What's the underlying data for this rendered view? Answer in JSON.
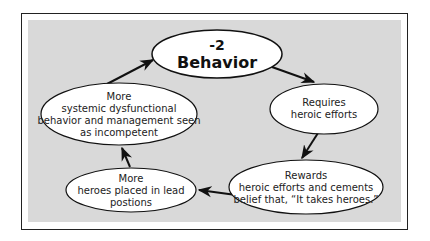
{
  "diagram": {
    "type": "cycle",
    "nodes": [
      {
        "id": "behavior",
        "lines": [
          "-2",
          "Behavior"
        ]
      },
      {
        "id": "requires",
        "lines": [
          "Requires",
          "heroic efforts"
        ]
      },
      {
        "id": "rewards",
        "lines": [
          "Rewards",
          "heroic efforts and cements",
          "belief that, “It takes heroes.”"
        ]
      },
      {
        "id": "heroes",
        "lines": [
          "More",
          "heroes placed in lead",
          "postions"
        ]
      },
      {
        "id": "systemic",
        "lines": [
          "More",
          "systemic dysfunctional",
          "behavior and management seen",
          "as incompetent"
        ]
      }
    ],
    "edges": [
      {
        "from": "behavior",
        "to": "requires"
      },
      {
        "from": "requires",
        "to": "rewards"
      },
      {
        "from": "rewards",
        "to": "heroes"
      },
      {
        "from": "heroes",
        "to": "systemic"
      },
      {
        "from": "systemic",
        "to": "behavior"
      }
    ],
    "colors": {
      "background": "#d9d9d9",
      "node_fill": "#ffffff",
      "stroke": "#111111"
    }
  }
}
